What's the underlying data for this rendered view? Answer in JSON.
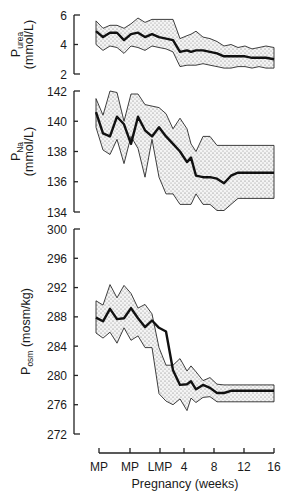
{
  "chart_data": {
    "type": "line",
    "xlabel": "Pregnancy (weeks)",
    "x_tick_labels": [
      "MP",
      "MP",
      "LMP",
      "4",
      "8",
      "12",
      "16"
    ],
    "x_tick_px": [
      99,
      130,
      160,
      184,
      214,
      244,
      274
    ],
    "x_px": [
      96,
      103,
      110,
      117,
      124,
      131,
      138,
      145,
      152,
      159,
      166,
      173,
      180,
      187,
      191,
      196,
      203,
      210,
      217,
      224,
      231,
      238,
      245,
      252,
      259,
      266,
      274
    ],
    "panels": [
      {
        "id": "urea",
        "ylabel_main": "P",
        "ylabel_sub": "urea",
        "ylabel_unit": "(mmol/L)",
        "yticks": [
          6,
          4,
          2
        ],
        "ylim": [
          2,
          6
        ],
        "px": {
          "top": 15,
          "bottom": 74
        },
        "series": [
          {
            "name": "mean",
            "values": [
              4.9,
              4.5,
              4.8,
              4.8,
              4.3,
              4.7,
              4.8,
              4.5,
              4.7,
              4.5,
              4.4,
              4.3,
              3.5,
              3.6,
              3.5,
              3.6,
              3.6,
              3.5,
              3.4,
              3.2,
              3.2,
              3.2,
              3.2,
              3.1,
              3.1,
              3.1,
              3.0
            ]
          },
          {
            "name": "upper",
            "values": [
              5.6,
              5.1,
              5.3,
              5.3,
              5.1,
              5.4,
              5.8,
              5.5,
              5.7,
              5.7,
              5.7,
              5.7,
              4.4,
              4.6,
              4.7,
              4.9,
              4.5,
              4.4,
              4.2,
              3.9,
              4.0,
              3.8,
              3.9,
              3.7,
              3.8,
              3.9,
              3.8
            ]
          },
          {
            "name": "lower",
            "values": [
              4.0,
              3.6,
              3.9,
              3.8,
              3.4,
              3.9,
              3.8,
              3.6,
              3.9,
              3.8,
              3.7,
              3.5,
              2.5,
              2.6,
              2.6,
              2.6,
              2.7,
              2.6,
              2.5,
              2.4,
              2.4,
              2.5,
              2.5,
              2.4,
              2.5,
              2.4,
              2.4
            ]
          }
        ]
      },
      {
        "id": "sodium",
        "ylabel_main": "P",
        "ylabel_sub": "Na",
        "ylabel_unit": "(mmol/L)",
        "yticks": [
          142,
          140,
          138,
          136,
          134
        ],
        "ylim": [
          134,
          142
        ],
        "px": {
          "top": 91,
          "bottom": 212
        },
        "series": [
          {
            "name": "mean",
            "values": [
              140.6,
              139.2,
              139.0,
              140.3,
              139.8,
              138.5,
              140.3,
              139.4,
              139.0,
              139.6,
              139.0,
              138.5,
              138.0,
              137.3,
              137.6,
              136.4,
              136.3,
              136.3,
              136.2,
              135.9,
              136.4,
              136.6,
              136.6,
              136.6,
              136.6,
              136.6,
              136.6
            ]
          },
          {
            "name": "upper",
            "values": [
              141.5,
              140.4,
              142.0,
              141.9,
              140.0,
              141.8,
              141.8,
              141.1,
              141.0,
              140.9,
              140.5,
              139.5,
              140.2,
              139.5,
              138.5,
              138.0,
              139.0,
              139.0,
              138.4,
              138.4,
              138.4,
              138.4,
              138.4,
              138.4,
              138.4,
              138.4,
              138.4
            ]
          },
          {
            "name": "lower",
            "values": [
              139.6,
              138.1,
              137.8,
              138.8,
              137.2,
              139.0,
              138.2,
              136.3,
              138.8,
              136.3,
              135.2,
              135.2,
              134.5,
              134.5,
              134.5,
              135.2,
              134.5,
              134.5,
              134.1,
              134.1,
              134.5,
              134.9,
              134.9,
              134.9,
              134.9,
              134.9,
              134.9
            ]
          }
        ]
      },
      {
        "id": "osmolality",
        "ylabel_main": "P",
        "ylabel_sub": "osm",
        "ylabel_unit": "(mosm/kg)",
        "yticks": [
          300,
          296,
          292,
          288,
          284,
          280,
          276,
          272
        ],
        "ylim": [
          272,
          300
        ],
        "px": {
          "top": 229,
          "bottom": 434
        },
        "series": [
          {
            "name": "mean",
            "values": [
              287.9,
              287.4,
              289.1,
              287.7,
              287.8,
              289.2,
              287.8,
              286.6,
              287.5,
              286.5,
              286.0,
              280.7,
              278.7,
              278.8,
              279.2,
              278.1,
              278.7,
              278.3,
              277.6,
              277.6,
              277.9,
              277.9,
              277.9,
              277.9,
              277.9,
              277.9,
              277.9
            ]
          },
          {
            "name": "upper",
            "values": [
              290.2,
              289.6,
              292.4,
              290.6,
              292.3,
              291.2,
              289.2,
              289.7,
              288.4,
              283.8,
              281.4,
              281.4,
              282.3,
              280.6,
              281.3,
              280.5,
              279.3,
              279.7,
              278.8,
              278.7,
              278.7,
              278.7,
              278.7,
              278.7,
              278.7,
              278.7,
              278.7
            ]
          },
          {
            "name": "lower",
            "values": [
              285.8,
              285.1,
              285.9,
              284.4,
              286.5,
              284.8,
              285.4,
              283.8,
              283.8,
              277.5,
              276.5,
              276.0,
              276.8,
              275.2,
              276.9,
              276.3,
              277.0,
              277.1,
              276.4,
              276.4,
              276.4,
              276.4,
              276.4,
              276.4,
              276.4,
              276.4,
              276.4
            ]
          }
        ]
      }
    ],
    "grid": false,
    "legend": "none"
  }
}
